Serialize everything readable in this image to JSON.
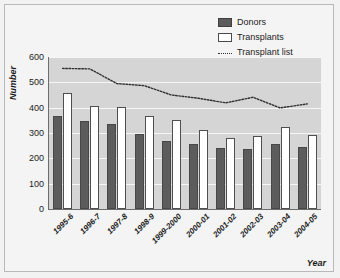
{
  "chart_data": {
    "type": "bar",
    "title": "",
    "xlabel": "Year",
    "ylabel": "Number",
    "ylim": [
      0,
      600
    ],
    "yticks": [
      0,
      100,
      200,
      300,
      400,
      500,
      600
    ],
    "grid": true,
    "legend_position": "top-right",
    "categories": [
      "1995-6",
      "1996-7",
      "1997-8",
      "1998-9",
      "1999-2000",
      "2000-01",
      "2001-02",
      "2002-03",
      "2003-04",
      "2004-05"
    ],
    "series": [
      {
        "name": "Donors",
        "type": "bar",
        "color": "#5c5c5c",
        "values": [
          368,
          348,
          334,
          298,
          270,
          255,
          241,
          237,
          258,
          245
        ]
      },
      {
        "name": "Transplants",
        "type": "bar",
        "color": "#ffffff",
        "values": [
          458,
          408,
          404,
          366,
          353,
          312,
          280,
          290,
          322,
          291
        ]
      },
      {
        "name": "Transplant list",
        "type": "line",
        "style": "dotted",
        "color": "#303030",
        "values": [
          555,
          553,
          495,
          487,
          450,
          437,
          419,
          441,
          399,
          415
        ]
      }
    ]
  },
  "legend": {
    "items": [
      {
        "label": "Donors",
        "marker": "filled-square-swatch"
      },
      {
        "label": "Transplants",
        "marker": "outlined-square-swatch"
      },
      {
        "label": "Transplant list",
        "marker": "dotted-line-swatch"
      }
    ]
  },
  "colors": {
    "plot_background": "#d5d5d5",
    "figure_background": "#f4f4f4",
    "donors": "#5c5c5c",
    "transplants": "#ffffff",
    "transplant_list": "#303030",
    "gridline": "#f6f6f6",
    "axis": "#6d6d6d"
  }
}
